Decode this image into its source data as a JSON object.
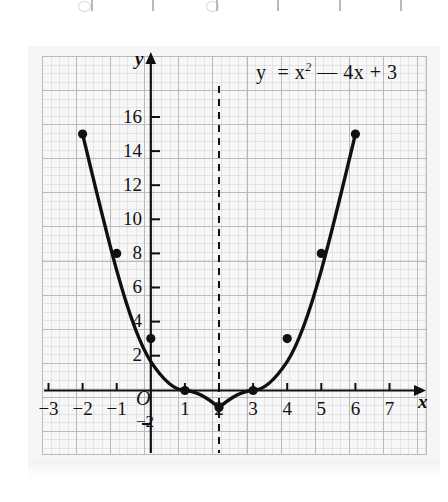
{
  "figure": {
    "equation_html": "y&nbsp; = x<sup>2</sup> &mdash; 4x + 3",
    "equation_text": "y = x2 - 4x + 3",
    "x_axis_label": "x",
    "y_axis_label": "y",
    "origin_label": "O"
  },
  "chart_data": {
    "type": "line",
    "subtitle": "",
    "xlabel": "x",
    "ylabel": "y",
    "xlim": [
      -3.5,
      7.7
    ],
    "ylim": [
      -2.5,
      17.5
    ],
    "x_ticks": [
      -3,
      -2,
      -1,
      1,
      2,
      3,
      4,
      5,
      6,
      7
    ],
    "x_tick_labels": [
      "−3",
      "−2",
      "−1",
      "1",
      "2",
      "3",
      "4",
      "5",
      "6",
      "7"
    ],
    "y_ticks": [
      -2,
      2,
      4,
      6,
      8,
      10,
      12,
      14,
      16
    ],
    "y_tick_labels": [
      "−2",
      "2",
      "4",
      "6",
      "8",
      "10",
      "12",
      "14",
      "16"
    ],
    "grid": true,
    "legend": "none",
    "series": [
      {
        "name": "y = x² − 4x + 3",
        "marker": "filled-circle",
        "x": [
          -2,
          -1,
          0,
          1,
          2,
          3,
          4,
          5,
          6
        ],
        "values": [
          15,
          8,
          3,
          0,
          -1,
          0,
          3,
          8,
          15
        ]
      }
    ],
    "annotations": [
      {
        "type": "vertical-dashed-line",
        "name": "axis-of-symmetry",
        "x": 2,
        "label": ""
      },
      {
        "type": "vertex",
        "name": "vertex",
        "x": 2,
        "y": -1
      },
      {
        "type": "root",
        "name": "root-1",
        "x": 1,
        "y": 0
      },
      {
        "type": "root",
        "name": "root-2",
        "x": 3,
        "y": 0
      }
    ]
  },
  "colors": {
    "curve": "#101010",
    "grid_major": "#b9b9c3",
    "axis": "#101010",
    "paper": "#f6f6f6",
    "plot_background": "#f7f7f7"
  }
}
